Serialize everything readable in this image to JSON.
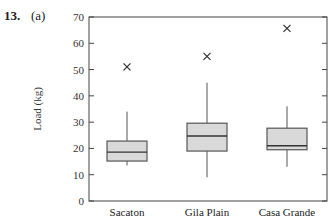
{
  "problem": {
    "number": "13.",
    "part": "(a)"
  },
  "chart_data": {
    "type": "box",
    "title": "",
    "xlabel": "",
    "ylabel": "Load (kg)",
    "ylim": [
      0,
      70
    ],
    "yticks": [
      0,
      10,
      20,
      30,
      40,
      50,
      60,
      70
    ],
    "grid": false,
    "categories": [
      "Sacaton",
      "Gila Plain",
      "Casa Grande"
    ],
    "series": [
      {
        "name": "Sacaton",
        "whisker_low": 13.5,
        "q1": 15.2,
        "median": 18.6,
        "q3": 22.8,
        "whisker_high": 34,
        "outliers": [
          51
        ]
      },
      {
        "name": "Gila Plain",
        "whisker_low": 9,
        "q1": 19,
        "median": 24.7,
        "q3": 29.6,
        "whisker_high": 45,
        "outliers": [
          55
        ]
      },
      {
        "name": "Casa Grande",
        "whisker_low": 13,
        "q1": 19.5,
        "median": 21,
        "q3": 27.7,
        "whisker_high": 36,
        "outliers": [
          65.7
        ]
      }
    ],
    "colors": {
      "box_fill": "#d9d9d9",
      "box_stroke": "#555555",
      "axis": "#444444"
    }
  }
}
